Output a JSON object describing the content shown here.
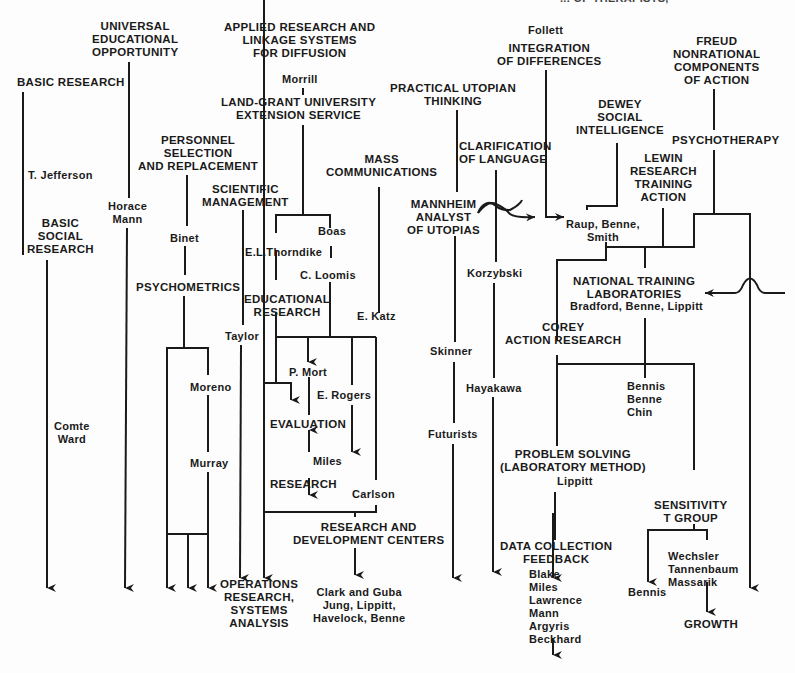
{
  "header_cut_text": "... OF THERAPISTS,",
  "nodes": {
    "basic_research": "BASIC RESEARCH",
    "t_jefferson": "T. Jefferson",
    "basic_social_research": "BASIC\nSOCIAL\nRESEARCH",
    "comte_ward": "Comte\nWard",
    "universal_edu": "UNIVERSAL\nEDUCATIONAL\nOPPORTUNITY",
    "horace_mann": "Horace\nMann",
    "personnel_selection": "PERSONNEL\nSELECTION\nAND REPLACEMENT",
    "binet": "Binet",
    "psychometrics": "PSYCHOMETRICS",
    "moreno": "Moreno",
    "murray": "Murray",
    "scientific_management": "SCIENTIFIC\nMANAGEMENT",
    "taylor": "Taylor",
    "operations_research": "OPERATIONS\nRESEARCH,\nSYSTEMS\nANALYSIS",
    "applied_research": "APPLIED RESEARCH AND\nLINKAGE SYSTEMS\nFOR DIFFUSION",
    "morrill": "Morrill",
    "land_grant": "LAND-GRANT UNIVERSITY\nEXTENSION SERVICE",
    "boas": "Boas",
    "thorndike": "E.L.Thorndike",
    "loomis": "C. Loomis",
    "educational_research": "EDUCATIONAL\nRESEARCH",
    "p_mort": "P. Mort",
    "e_rogers": "E. Rogers",
    "evaluation": "EVALUATION",
    "miles": "Miles",
    "research": "RESEARCH",
    "carlson": "Carlson",
    "rd_centers": "RESEARCH AND\nDEVELOPMENT CENTERS",
    "clark_guba": "Clark and Guba\nJung, Lippitt,\nHavelock, Benne",
    "mass_communications": "MASS\nCOMMUNICATIONS",
    "e_katz": "E. Katz",
    "practical_utopian": "PRACTICAL UTOPIAN\nTHINKING",
    "mannheim": "Mannheim\nANALYST\nOF UTOPIAS",
    "skinner": "Skinner",
    "futurists": "Futurists",
    "clarification_language": "CLARIFICATION\nOF LANGUAGE",
    "korzybski": "Korzybski",
    "hayakawa": "Hayakawa",
    "follett": "Follett",
    "integration_differences": "INTEGRATION\nOF DIFFERENCES",
    "dewey": "Dewey\nSOCIAL\nINTELLIGENCE",
    "raup_benne_smith": "Raup, Benne,\nSmith",
    "lewin": "Lewin\nRESEARCH\nTRAINING\nACTION",
    "freud": "Freud\nNONRATIONAL\nCOMPONENTS\nOF ACTION",
    "psychotherapy": "PSYCHOTHERAPY",
    "ntl": "NATIONAL TRAINING\nLABORATORIES",
    "ntl_people": "Bradford, Benne, Lippitt",
    "corey_action": "Corey\nACTION RESEARCH",
    "bennis_benne_chin": "Bennis\nBenne\nChin",
    "problem_solving": "PROBLEM SOLVING\n(LABORATORY METHOD)",
    "lippitt": "Lippitt",
    "data_collection": "DATA COLLECTION\nFEEDBACK",
    "data_people": "Blake\nMiles\nLawrence\nMann\nArgyris\nBeckhard",
    "sensitivity": "SENSITIVITY\nT GROUP",
    "bennis": "Bennis",
    "wechsler": "Wechsler\nTannenbaum\nMassarik",
    "growth": "GROWTH"
  },
  "colors": {
    "ink": "#1a1a1a",
    "paper": "#fdfdfd"
  }
}
